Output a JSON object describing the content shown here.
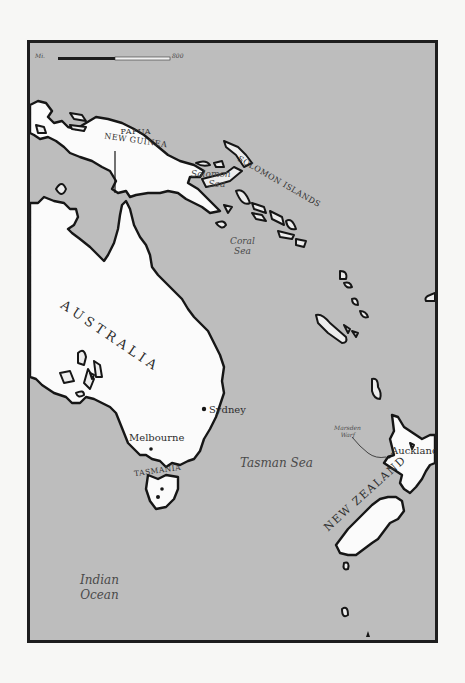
{
  "map": {
    "colors": {
      "water": "#bdbdbd",
      "land": "#fbfbfb",
      "coastline": "#161616",
      "frame": "#1e1e1e",
      "page": "#f7f7f5"
    },
    "scale_bar": {
      "unit_label": "Mi.",
      "max_label": "800"
    },
    "countries": {
      "png": [
        "PAPUA",
        "NEW GUINEA"
      ],
      "solomon": "SOLOMON ISLANDS",
      "australia": "AUSTRALIA",
      "tasmania": "TASMANIA",
      "nz": "NEW ZEALAND"
    },
    "seas": {
      "solomon": [
        "Solomon",
        "Sea"
      ],
      "coral": [
        "Coral",
        "Sea"
      ],
      "tasman": "Tasman Sea",
      "indian": [
        "Indian",
        "Ocean"
      ]
    },
    "cities": {
      "sydney": "Sydney",
      "melbourne": "Melbourne",
      "auckland": "Auckland",
      "marsden": [
        "Marsden",
        "Warf"
      ]
    }
  }
}
